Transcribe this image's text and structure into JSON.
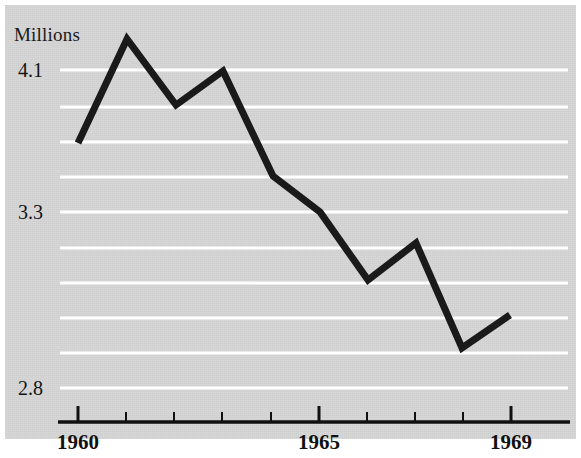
{
  "figure": {
    "plate_background": "#d5d5d5",
    "page_background": "#ffffff",
    "line_color": "#1a1a1a",
    "gridline_color": "#ffffff",
    "axis_color": "#111111"
  },
  "axes": {
    "y_unit_label": "Millions",
    "y_tick_labels": [
      {
        "text": "4.1",
        "y": 70
      },
      {
        "text": "3.3",
        "y": 212
      },
      {
        "text": "2.8",
        "y": 388
      }
    ],
    "gridlines_y": [
      70,
      107,
      142,
      177,
      212,
      248,
      283,
      318,
      353,
      388
    ],
    "x_tick_positions": [
      78,
      126,
      174,
      222,
      271,
      319,
      367,
      415,
      463,
      511
    ],
    "x_major_ticks": [
      78,
      319,
      511
    ],
    "x_tick_labels": [
      {
        "text": "1960",
        "x": 78
      },
      {
        "text": "1965",
        "x": 319
      },
      {
        "text": "1969",
        "x": 511
      }
    ],
    "axis_line": {
      "x1": 58,
      "x2": 570,
      "y": 422
    }
  },
  "chart_data": {
    "type": "line",
    "title": "",
    "subtitle": "",
    "xlabel": "",
    "ylabel": "Millions",
    "grid": true,
    "legend": "none",
    "x": [
      1960,
      1961,
      1962,
      1963,
      1964,
      1965,
      1966,
      1967,
      1968,
      1969
    ],
    "categories": [
      "1960",
      "1961",
      "1962",
      "1963",
      "1964",
      "1965",
      "1966",
      "1967",
      "1968",
      "1969"
    ],
    "values": [
      3.7,
      4.28,
      3.9,
      4.1,
      3.52,
      3.3,
      3.11,
      3.21,
      2.91,
      3.0
    ],
    "series": [
      {
        "name": "Millions",
        "values": [
          3.7,
          4.28,
          3.9,
          4.1,
          3.52,
          3.3,
          3.11,
          3.21,
          2.91,
          3.0
        ]
      }
    ],
    "pixel_points": [
      {
        "x": 78,
        "y": 143
      },
      {
        "x": 127,
        "y": 39
      },
      {
        "x": 176,
        "y": 105
      },
      {
        "x": 223,
        "y": 71
      },
      {
        "x": 273,
        "y": 176
      },
      {
        "x": 320,
        "y": 212
      },
      {
        "x": 368,
        "y": 280
      },
      {
        "x": 416,
        "y": 243
      },
      {
        "x": 462,
        "y": 348
      },
      {
        "x": 510,
        "y": 315
      }
    ],
    "ylim": [
      2.8,
      4.3
    ],
    "xlim": [
      1960,
      1969
    ],
    "ytick_values": [
      4.1,
      3.3,
      2.8
    ],
    "axis_note": "non-linear / compressed vertical scale"
  }
}
